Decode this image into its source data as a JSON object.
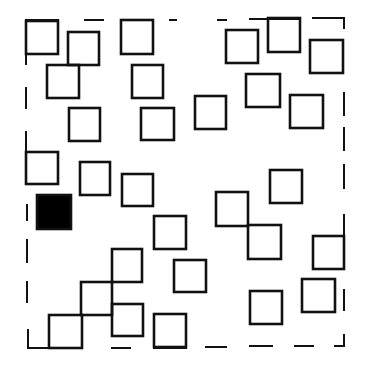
{
  "diagram": {
    "stroke_color": "#111111",
    "fill_color": "#000000",
    "background": "#ffffff",
    "border": {
      "style": "dashed",
      "segments": [
        {
          "x1": 26,
          "y1": 20,
          "x2": 58,
          "y2": 20
        },
        {
          "x1": 85,
          "y1": 20,
          "x2": 103,
          "y2": 20
        },
        {
          "x1": 170,
          "y1": 20,
          "x2": 176,
          "y2": 20
        },
        {
          "x1": 218,
          "y1": 20,
          "x2": 226,
          "y2": 20
        },
        {
          "x1": 250,
          "y1": 19,
          "x2": 300,
          "y2": 19
        },
        {
          "x1": 313,
          "y1": 18,
          "x2": 344,
          "y2": 18
        },
        {
          "x1": 344,
          "y1": 18,
          "x2": 344,
          "y2": 28
        },
        {
          "x1": 344,
          "y1": 93,
          "x2": 344,
          "y2": 115
        },
        {
          "x1": 344,
          "y1": 128,
          "x2": 344,
          "y2": 150
        },
        {
          "x1": 344,
          "y1": 165,
          "x2": 344,
          "y2": 188
        },
        {
          "x1": 344,
          "y1": 215,
          "x2": 344,
          "y2": 236
        },
        {
          "x1": 344,
          "y1": 290,
          "x2": 344,
          "y2": 310
        },
        {
          "x1": 344,
          "y1": 335,
          "x2": 344,
          "y2": 346
        },
        {
          "x1": 335,
          "y1": 346,
          "x2": 344,
          "y2": 346
        },
        {
          "x1": 295,
          "y1": 346,
          "x2": 313,
          "y2": 346
        },
        {
          "x1": 250,
          "y1": 346,
          "x2": 272,
          "y2": 346
        },
        {
          "x1": 206,
          "y1": 347,
          "x2": 226,
          "y2": 347
        },
        {
          "x1": 154,
          "y1": 348,
          "x2": 186,
          "y2": 348
        },
        {
          "x1": 112,
          "y1": 348,
          "x2": 130,
          "y2": 348
        },
        {
          "x1": 28,
          "y1": 348,
          "x2": 82,
          "y2": 348
        },
        {
          "x1": 28,
          "y1": 330,
          "x2": 28,
          "y2": 348
        },
        {
          "x1": 27,
          "y1": 282,
          "x2": 27,
          "y2": 302
        },
        {
          "x1": 27,
          "y1": 240,
          "x2": 27,
          "y2": 262
        },
        {
          "x1": 27,
          "y1": 205,
          "x2": 27,
          "y2": 220
        },
        {
          "x1": 26,
          "y1": 132,
          "x2": 26,
          "y2": 152
        },
        {
          "x1": 26,
          "y1": 88,
          "x2": 26,
          "y2": 108
        },
        {
          "x1": 26,
          "y1": 54,
          "x2": 26,
          "y2": 64
        }
      ]
    },
    "squares": [
      {
        "id": "A",
        "x": 26,
        "y": 21,
        "w": 32,
        "h": 33,
        "filled": false
      },
      {
        "id": "B",
        "x": 68,
        "y": 32,
        "w": 31,
        "h": 33,
        "filled": false
      },
      {
        "id": "C",
        "x": 121,
        "y": 20,
        "w": 32,
        "h": 34,
        "filled": false
      },
      {
        "id": "D",
        "x": 47,
        "y": 65,
        "w": 32,
        "h": 33,
        "filled": false
      },
      {
        "id": "E",
        "x": 132,
        "y": 65,
        "w": 31,
        "h": 33,
        "filled": false
      },
      {
        "id": "F",
        "x": 69,
        "y": 108,
        "w": 31,
        "h": 33,
        "filled": false
      },
      {
        "id": "G",
        "x": 141,
        "y": 108,
        "w": 33,
        "h": 32,
        "filled": false
      },
      {
        "id": "K",
        "x": 226,
        "y": 30,
        "w": 32,
        "h": 33,
        "filled": false
      },
      {
        "id": "L",
        "x": 268,
        "y": 18,
        "w": 32,
        "h": 34,
        "filled": false
      },
      {
        "id": "M",
        "x": 310,
        "y": 40,
        "w": 33,
        "h": 33,
        "filled": false
      },
      {
        "id": "N",
        "x": 246,
        "y": 74,
        "w": 34,
        "h": 33,
        "filled": false
      },
      {
        "id": "O",
        "x": 195,
        "y": 96,
        "w": 31,
        "h": 33,
        "filled": false
      },
      {
        "id": "P",
        "x": 290,
        "y": 95,
        "w": 33,
        "h": 33,
        "filled": false
      },
      {
        "id": "H",
        "x": 26,
        "y": 152,
        "w": 32,
        "h": 32,
        "filled": false
      },
      {
        "id": "I",
        "x": 80,
        "y": 162,
        "w": 30,
        "h": 33,
        "filled": false
      },
      {
        "id": "J",
        "x": 122,
        "y": 174,
        "w": 31,
        "h": 32,
        "filled": false
      },
      {
        "id": "black",
        "x": 37,
        "y": 195,
        "w": 34,
        "h": 34,
        "filled": true
      },
      {
        "id": "Q",
        "x": 154,
        "y": 216,
        "w": 32,
        "h": 33,
        "filled": false
      },
      {
        "id": "R",
        "x": 270,
        "y": 170,
        "w": 32,
        "h": 33,
        "filled": false
      },
      {
        "id": "S",
        "x": 216,
        "y": 192,
        "w": 32,
        "h": 34,
        "filled": false
      },
      {
        "id": "T",
        "x": 248,
        "y": 225,
        "w": 33,
        "h": 34,
        "filled": false
      },
      {
        "id": "U",
        "x": 313,
        "y": 236,
        "w": 31,
        "h": 33,
        "filled": false
      },
      {
        "id": "V",
        "x": 112,
        "y": 249,
        "w": 30,
        "h": 33,
        "filled": false
      },
      {
        "id": "W",
        "x": 174,
        "y": 260,
        "w": 32,
        "h": 32,
        "filled": false
      },
      {
        "id": "X",
        "x": 81,
        "y": 282,
        "w": 31,
        "h": 33,
        "filled": false
      },
      {
        "id": "Y",
        "x": 112,
        "y": 304,
        "w": 31,
        "h": 32,
        "filled": false
      },
      {
        "id": "Z",
        "x": 49,
        "y": 315,
        "w": 33,
        "h": 33,
        "filled": false
      },
      {
        "id": "AA",
        "x": 154,
        "y": 314,
        "w": 32,
        "h": 33,
        "filled": false
      },
      {
        "id": "BB",
        "x": 250,
        "y": 291,
        "w": 32,
        "h": 33,
        "filled": false
      },
      {
        "id": "CC",
        "x": 302,
        "y": 279,
        "w": 33,
        "h": 33,
        "filled": false
      }
    ],
    "counts": {
      "outlined_squares": 29,
      "filled_squares": 1
    }
  }
}
